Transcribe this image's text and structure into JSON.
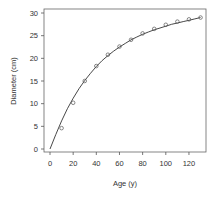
{
  "chart_data": {
    "type": "scatter",
    "title": "",
    "xlabel": "Age (y)",
    "ylabel": "Diameter (cm)",
    "xlim": [
      -5,
      135
    ],
    "ylim": [
      -1,
      30
    ],
    "xticks": [
      0,
      20,
      40,
      60,
      80,
      100,
      120
    ],
    "yticks": [
      0,
      5,
      10,
      15,
      20,
      25,
      30
    ],
    "grid": false,
    "legend": null,
    "series": [
      {
        "name": "observed",
        "style": "open-circle",
        "x": [
          10,
          20,
          30,
          40,
          50,
          60,
          70,
          80,
          90,
          100,
          110,
          120,
          130
        ],
        "y": [
          4.6,
          10.2,
          15.0,
          18.3,
          20.8,
          22.6,
          24.1,
          25.5,
          26.5,
          27.4,
          28.1,
          28.6,
          29.0
        ]
      },
      {
        "name": "fitted curve",
        "style": "line",
        "x": [
          0,
          5,
          10,
          15,
          20,
          25,
          30,
          35,
          40,
          45,
          50,
          55,
          60,
          65,
          70,
          75,
          80,
          85,
          90,
          95,
          100,
          105,
          110,
          115,
          120,
          125,
          130
        ],
        "y": [
          0,
          3.2,
          6.2,
          8.9,
          11.2,
          13.3,
          15.1,
          16.7,
          18.2,
          19.5,
          20.6,
          21.6,
          22.5,
          23.3,
          24.1,
          24.7,
          25.3,
          25.8,
          26.3,
          26.7,
          27.1,
          27.5,
          27.8,
          28.1,
          28.4,
          28.7,
          29.0
        ]
      }
    ]
  },
  "colors": {
    "axis": "#555555",
    "line": "#333333",
    "marker": "#555555",
    "background": "#ffffff"
  }
}
